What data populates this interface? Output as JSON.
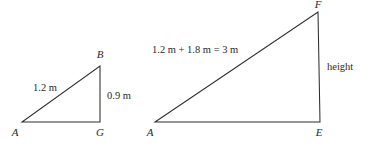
{
  "figure": {
    "background_color": "#ffffff",
    "line_color": "#2e2e2e",
    "text_color": "#2a2a2a"
  },
  "small_triangle": {
    "name": "triangle-ABG",
    "vertices": {
      "A": {
        "label": "A",
        "x": 22,
        "y": 122
      },
      "G": {
        "label": "G",
        "x": 100,
        "y": 122
      },
      "B": {
        "label": "B",
        "x": 100,
        "y": 66
      }
    },
    "labels": {
      "hypotenuse": "1.2 m",
      "vertical_leg": "0.9 m"
    }
  },
  "large_triangle": {
    "name": "triangle-AEF",
    "vertices": {
      "A": {
        "label": "A",
        "x": 155,
        "y": 122
      },
      "E": {
        "label": "E",
        "x": 320,
        "y": 122
      },
      "F": {
        "label": "F",
        "x": 318,
        "y": 12
      }
    },
    "labels": {
      "hypotenuse": "1.2 m + 1.8 m = 3 m",
      "vertical_leg": "height"
    }
  }
}
